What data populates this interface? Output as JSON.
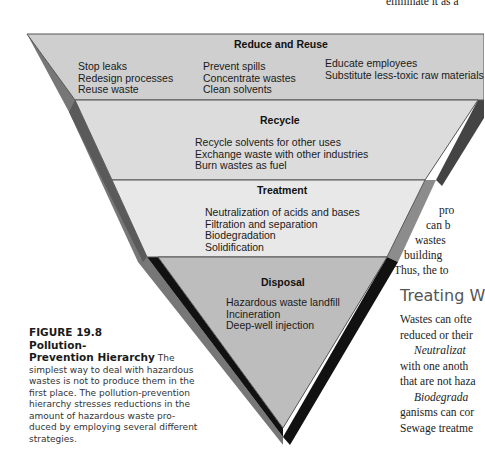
{
  "top_text_fragment": "eliminate it as a",
  "pyramid": {
    "levels": [
      {
        "title": "Reduce and Reuse",
        "columns": [
          [
            "Stop leaks",
            "Redesign processes",
            "Reuse waste"
          ],
          [
            "Prevent spills",
            "Concentrate wastes",
            "Clean solvents"
          ],
          [
            "Educate employees",
            "Substitute less-toxic raw materials"
          ]
        ],
        "color": "#cfcfcf"
      },
      {
        "title": "Recycle",
        "items": [
          "Recycle solvents for other uses",
          "Exchange waste with other industries",
          "Burn wastes as fuel"
        ],
        "color": "#dcdcdc"
      },
      {
        "title": "Treatment",
        "items": [
          "Neutralization of acids and bases",
          "Filtration and separation",
          "Biodegradation",
          "Solidification"
        ],
        "color": "#e6e6e6"
      },
      {
        "title": "Disposal",
        "items": [
          "Hazardous waste landfill",
          "Incineration",
          "Deep-well injection"
        ],
        "color": "#bdbdbd"
      }
    ]
  },
  "caption": {
    "label": "FIGURE 19.8 Pollution-Prevention Hierarchy",
    "label_line1": "FIGURE 19.8  Pollution-",
    "label_line2": "Prevention Hierarchy",
    "text_first": "The",
    "lines": [
      "simplest way to deal with hazardous",
      "wastes is not to produce them in the",
      "first place. The pollution-prevention",
      "hierarchy stresses reductions in the",
      "amount of hazardous waste pro-",
      "duced by employing several different",
      "strategies."
    ]
  },
  "right_column": {
    "fragments_upper": [
      "pro",
      "can  b",
      "wastes",
      "building",
      "Thus, the to"
    ],
    "section_heading": "Treating W",
    "paragraph_lines": [
      {
        "text": "Wastes can ofte",
        "italic_prefix": ""
      },
      {
        "text": "reduced or their",
        "italic_prefix": ""
      },
      {
        "text": "",
        "italic_prefix": "Neutralizat"
      },
      {
        "text": "with one anoth",
        "italic_prefix": ""
      },
      {
        "text": "that are not haza",
        "italic_prefix": ""
      },
      {
        "text": "",
        "italic_prefix": "Biodegrada"
      },
      {
        "text": "ganisms can cor",
        "italic_prefix": ""
      },
      {
        "text": "Sewage treatme",
        "italic_prefix": ""
      }
    ]
  }
}
